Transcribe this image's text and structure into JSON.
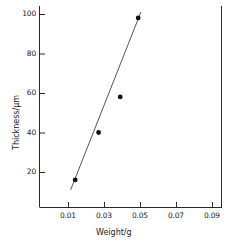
{
  "chart_data": {
    "type": "scatter",
    "title": "",
    "xlabel": "Weight/g",
    "ylabel": "Thickness/µm",
    "xlim": [
      0.0,
      0.0955
    ],
    "ylim": [
      0.0,
      106.0
    ],
    "grid": false,
    "legend": null,
    "xticks": [
      0.01,
      0.03,
      0.05,
      0.07,
      0.09
    ],
    "xticklabels": [
      "0.01",
      "0.03",
      "0.05",
      "0.07",
      "0.09"
    ],
    "yticks": [
      20,
      40,
      60,
      80,
      100
    ],
    "yticklabels": [
      "20",
      "40",
      "60",
      "80",
      "100"
    ],
    "series": [
      {
        "name": "measured points",
        "type": "scatter",
        "marker": "filled-circle",
        "color": "#111111",
        "x": [
          0.014,
          0.027,
          0.039,
          0.049
        ],
        "y": [
          16,
          40,
          58,
          98
        ]
      },
      {
        "name": "fitted line",
        "type": "line",
        "color": "#555555",
        "x": [
          0.0115,
          0.0505
        ],
        "y": [
          11,
          101
        ]
      }
    ]
  },
  "axes": {
    "x_axis_name": "weight-axis",
    "y_axis_name": "thickness-axis"
  }
}
